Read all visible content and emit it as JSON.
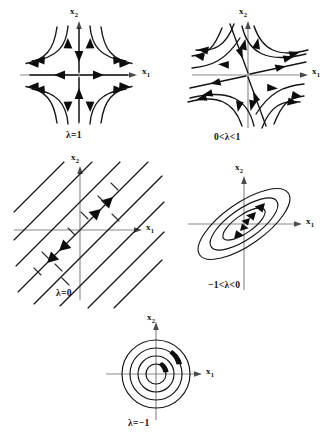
{
  "figure": {
    "kind": "phase-portrait-grid",
    "background_color": "#ffffff",
    "axis_color": "#8a8a8a",
    "curve_color": "#141414",
    "panel_count": 5
  },
  "axis_labels": {
    "x1": "x",
    "x1_sub": "1",
    "x2": "x",
    "x2_sub": "2"
  },
  "panels": [
    {
      "id": "saddle-lambda-1",
      "caption": "λ=1",
      "type": "saddle",
      "description": "hyperbolic saddle, axis-aligned; inflow along x2, outflow along x1",
      "stable_axis": "x2",
      "unstable_axis": "x1",
      "rotation_deg": 0
    },
    {
      "id": "saddle-0-lt-lambda-lt-1",
      "caption": "0<λ<1",
      "type": "saddle",
      "description": "hyperbolic saddle with tilted eigendirections",
      "stable_axis": "steep diagonal",
      "unstable_axis": "shallow diagonal",
      "rotation_deg": -32
    },
    {
      "id": "degenerate-lambda-0",
      "caption": "λ=0",
      "type": "parallel-lines",
      "description": "parallel straight-line trajectories of negative slope; flow toward origin along central line; dashed perpendicular marks",
      "line_count": 9,
      "slope_deg": -45
    },
    {
      "id": "spiral-minus1-lt-lambda-lt-0",
      "caption": "−1<λ<0",
      "type": "center-ellipses",
      "description": "nested tilted ellipses, clockwise flow",
      "ellipse_count": 3,
      "rotation_deg": -35
    },
    {
      "id": "center-lambda-minus-1",
      "caption": "λ=−1",
      "type": "center-circles",
      "description": "concentric circles, clockwise flow",
      "circle_count": 4
    }
  ]
}
